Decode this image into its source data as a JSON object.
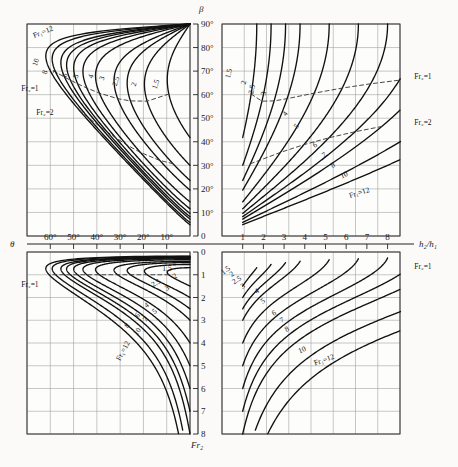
{
  "figure": {
    "title": ""
  },
  "axes": {
    "beta": {
      "symbol": "β",
      "position": "upper-center-vertical",
      "ticks": [
        "90°",
        "80°",
        "70°",
        "60°",
        "50°",
        "40°",
        "30°",
        "20°",
        "10°",
        "0"
      ],
      "values": [
        90,
        80,
        70,
        60,
        50,
        40,
        30,
        20,
        10,
        0
      ],
      "min": 0,
      "max": 90
    },
    "theta": {
      "symbol": "θ",
      "position": "center-left-horizontal",
      "ticks": [
        "60°",
        "50°",
        "40°",
        "30°",
        "20°",
        "10°"
      ],
      "values": [
        60,
        50,
        40,
        30,
        20,
        10
      ],
      "min": 0,
      "max": 70
    },
    "depth_ratio": {
      "symbol": "h₂/h₁",
      "position": "center-right-horizontal",
      "ticks": [
        "1",
        "2",
        "3",
        "4",
        "5",
        "6",
        "7",
        "8"
      ],
      "values": [
        1,
        2,
        3,
        4,
        5,
        6,
        7,
        8
      ],
      "min": 0,
      "max": 8.6
    },
    "fr2": {
      "symbol": "Fr₂",
      "position": "lower-center-vertical",
      "ticks": [
        "0",
        "1",
        "2",
        "3",
        "4",
        "5",
        "6",
        "7",
        "8"
      ],
      "values": [
        0,
        1,
        2,
        3,
        4,
        5,
        6,
        7,
        8
      ],
      "min": 0,
      "max": 8
    }
  },
  "chart_data": {
    "type": "line",
    "title": "",
    "xlabel": "θ  |  h₂/h₁",
    "ylabel": "β  |  Fr₂",
    "grid": true,
    "legend_position": "inline-curve-labels",
    "quadrants": [
      {
        "name": "upper-left",
        "x_axis": "theta",
        "y_axis": "beta",
        "x_range": [
          70,
          0
        ],
        "y_range": [
          0,
          90
        ],
        "curve_labels": [
          "Fr₁=12",
          "10",
          "8",
          "7",
          "6",
          "5",
          "4",
          "3",
          "2.5",
          "2",
          "1.5"
        ],
        "dashed_labels": [
          "Fr₂=1",
          "Fr₂=2"
        ]
      },
      {
        "name": "upper-right",
        "x_axis": "depth_ratio",
        "y_axis": "beta",
        "x_range": [
          0,
          8.6
        ],
        "y_range": [
          0,
          90
        ],
        "curve_labels": [
          "1.5",
          "2",
          "2.5",
          "3",
          "4",
          "5",
          "6",
          "7",
          "8",
          "10",
          "Fr₁=12"
        ],
        "dashed_labels": [
          "Fr₂=1",
          "Fr₂=2"
        ]
      },
      {
        "name": "lower-left",
        "x_axis": "theta",
        "y_axis": "fr2",
        "x_range": [
          70,
          0
        ],
        "y_range": [
          0,
          8
        ],
        "curve_labels": [
          "1.5",
          "2",
          "2.5",
          "3",
          "4",
          "5",
          "6",
          "7",
          "8",
          "10",
          "Fr₁=12"
        ],
        "dashed_labels": [
          "Fr₂=1"
        ]
      },
      {
        "name": "lower-right",
        "x_axis": "depth_ratio",
        "y_axis": "fr2",
        "x_range": [
          0,
          8.6
        ],
        "y_range": [
          0,
          8
        ],
        "curve_labels": [
          "1.5",
          "2",
          "2.5",
          "3",
          "4",
          "5",
          "6",
          "7",
          "8",
          "10",
          "Fr₁=12"
        ],
        "dashed_labels": [
          "Fr₂=1"
        ]
      }
    ],
    "series": [
      {
        "name": "Fr₁=1.5",
        "fr1": 1.5
      },
      {
        "name": "Fr₁=2",
        "fr1": 2
      },
      {
        "name": "Fr₁=2.5",
        "fr1": 2.5
      },
      {
        "name": "Fr₁=3",
        "fr1": 3
      },
      {
        "name": "Fr₁=4",
        "fr1": 4
      },
      {
        "name": "Fr₁=5",
        "fr1": 5
      },
      {
        "name": "Fr₁=6",
        "fr1": 6
      },
      {
        "name": "Fr₁=7",
        "fr1": 7
      },
      {
        "name": "Fr₁=8",
        "fr1": 8
      },
      {
        "name": "Fr₁=10",
        "fr1": 10
      },
      {
        "name": "Fr₁=12",
        "fr1": 12
      }
    ],
    "dashed_series": [
      {
        "name": "Fr₂=1",
        "fr2": 1
      },
      {
        "name": "Fr₂=2",
        "fr2": 2
      }
    ]
  },
  "annotations": {
    "ul_fr1_12": "Fr₁=12",
    "ul_10": "10",
    "ul_8": "8",
    "ul_7": "7",
    "ul_6": "6",
    "ul_5": "5",
    "ul_4": "4",
    "ul_3": "3",
    "ul_25": "2.5",
    "ul_2": "2",
    "ul_15": "1.5",
    "ul_fr2_1": "Fr₂=1",
    "ul_fr2_2": "Fr₂=2",
    "ur_15": "1.5",
    "ur_2": "2",
    "ur_25": "2.5",
    "ur_3": "3",
    "ur_4": "4",
    "ur_5": "5",
    "ur_6": "6",
    "ur_7": "7",
    "ur_8": "8",
    "ur_10": "10",
    "ur_fr1_12": "Fr₁=12",
    "ur_fr2_1": "Fr₂=1",
    "ur_fr2_2": "Fr₂=2",
    "ll_15": "1.5",
    "ll_2": "2",
    "ll_25": "2.5",
    "ll_3": "3",
    "ll_4": "4",
    "ll_5": "5",
    "ll_6": "6",
    "ll_7": "7",
    "ll_8": "8",
    "ll_10": "10",
    "ll_fr1_12": "Fr₁=12",
    "ll_fr2_1": "Fr₂=1",
    "lr_15": "1.5",
    "lr_2": "2",
    "lr_25": "2.5",
    "lr_3": "3",
    "lr_4": "4",
    "lr_5": "5",
    "lr_6": "6",
    "lr_7": "7",
    "lr_8": "8",
    "lr_10": "10",
    "lr_fr1_12": "Fr₁=12",
    "lr_fr2_1": "Fr₂=1"
  },
  "colors": {
    "curve": "#111111",
    "grid": "#9b9b9b",
    "frame": "#3a3a3a",
    "background": "#fbfaf8",
    "text": "#141414"
  }
}
